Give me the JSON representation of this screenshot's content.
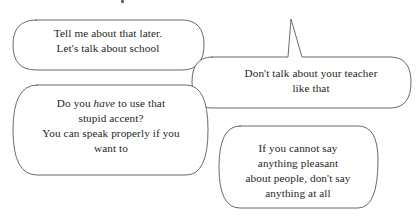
{
  "scene": {
    "type": "speech-bubble-illustration",
    "width": 420,
    "height": 215,
    "background_color": "#ffffff",
    "outline_color": "#58585c",
    "text_color": "#231f20",
    "bubble_fill": "#ffffff"
  },
  "bubbles": [
    {
      "id": "bubble-1",
      "order": 1,
      "tail": "none-visible",
      "lines": [
        "Tell me about that later.",
        "Let's talk about school"
      ],
      "text": "Tell me about that later.\nLet's talk about school"
    },
    {
      "id": "bubble-2",
      "order": 2,
      "tail": "top",
      "lines": [
        "Don't talk about your teacher",
        "like that"
      ],
      "text": "Don't talk about your teacher\nlike that"
    },
    {
      "id": "bubble-3",
      "order": 3,
      "tail": "right",
      "emphasis_word": "have",
      "lines": [
        "Do you have to use that",
        "stupid accent?",
        "You can speak properly if you",
        "want to"
      ],
      "line_1_prefix": "Do you ",
      "line_1_emphasis": "have",
      "line_1_suffix": " to use that",
      "line_2": "stupid accent?",
      "line_3": "You can speak properly if you",
      "line_4": "want to"
    },
    {
      "id": "bubble-4",
      "order": 4,
      "tail": "left",
      "lines": [
        "If you cannot say",
        "anything pleasant",
        "about people, don't say",
        "anything at all"
      ],
      "text": "If you cannot say\nanything pleasant\nabout people, don't say\nanything at all"
    }
  ]
}
